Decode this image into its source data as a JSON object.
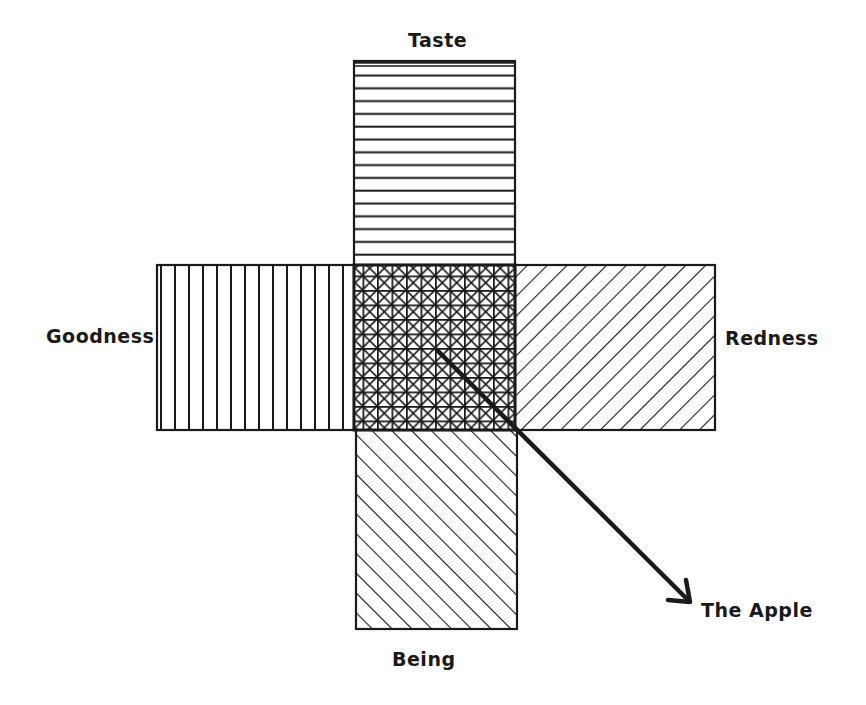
{
  "diagram": {
    "type": "cross-of-hatched-boxes",
    "labels": {
      "top": "Taste",
      "left": "Goodness",
      "right": "Redness",
      "bottom": "Being",
      "arrow_target": "The Apple"
    },
    "regions": [
      {
        "name": "Taste",
        "position": "top",
        "pattern": "horizontal-lines"
      },
      {
        "name": "Goodness",
        "position": "left",
        "pattern": "vertical-lines"
      },
      {
        "name": "Redness",
        "position": "right",
        "pattern": "diagonal-lines-forward"
      },
      {
        "name": "Being",
        "position": "bottom",
        "pattern": "diagonal-lines-backward"
      },
      {
        "name": "Intersection",
        "position": "center",
        "pattern": "dense-crosshatch"
      }
    ],
    "arrow": {
      "from": "center",
      "to": "The Apple"
    },
    "colors": {
      "ink": "#1a1a1a",
      "background": "#ffffff"
    }
  }
}
